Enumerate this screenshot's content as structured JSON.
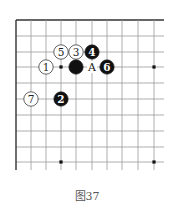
{
  "caption": "图37",
  "board": {
    "cols_x": [
      16,
      31,
      46,
      61,
      76,
      92,
      107,
      122,
      138,
      154
    ],
    "rows_y": [
      20,
      36,
      52,
      67,
      83,
      99,
      115,
      131,
      147,
      162
    ],
    "line_extend_right": 164,
    "line_extend_bottom": 170,
    "stone_radius": 7.2,
    "line_color": "#999999",
    "edge_color": "#333333",
    "star_points": [
      [
        3,
        3
      ],
      [
        9,
        3
      ],
      [
        3,
        9
      ],
      [
        9,
        9
      ]
    ],
    "stones": [
      {
        "color": "white",
        "col": 2,
        "row": 3,
        "label": "1"
      },
      {
        "color": "black",
        "col": 3,
        "row": 5,
        "label": "2"
      },
      {
        "color": "white",
        "col": 4,
        "row": 2,
        "label": "3"
      },
      {
        "color": "black",
        "col": 5,
        "row": 2,
        "label": "4"
      },
      {
        "color": "white",
        "col": 3,
        "row": 2,
        "label": "5"
      },
      {
        "color": "black",
        "col": 6,
        "row": 3,
        "label": "6"
      },
      {
        "color": "white",
        "col": 1,
        "row": 5,
        "label": "7"
      },
      {
        "color": "black",
        "col": 4,
        "row": 3,
        "label": ""
      }
    ],
    "markers": [
      {
        "col": 5,
        "row": 3,
        "label": "A"
      }
    ]
  }
}
